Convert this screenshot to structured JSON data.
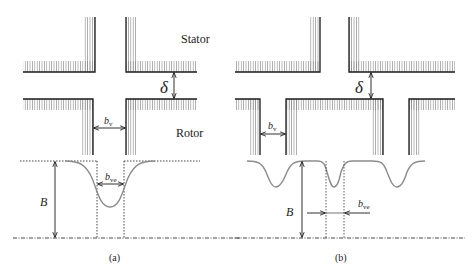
{
  "labels": {
    "stator": "Stator",
    "rotor": "Rotor",
    "delta": "δ",
    "bv_base": "b",
    "bv_sub": "v",
    "bve_base": "b",
    "bve_sub": "ve",
    "B": "B",
    "panel_a": "(a)",
    "panel_b": "(b)"
  },
  "colors": {
    "line": "#1a1a1a",
    "hatch": "#8a8a8a",
    "curve": "#8c8c8c",
    "text": "#222222"
  }
}
